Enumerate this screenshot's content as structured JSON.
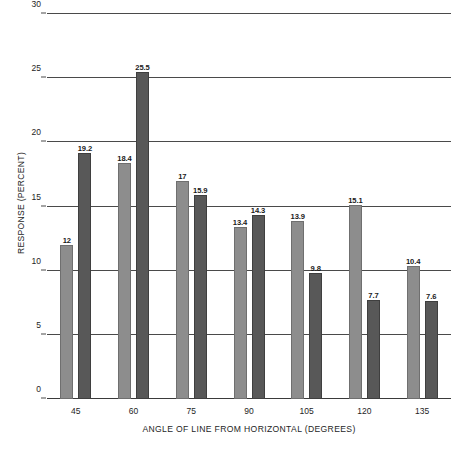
{
  "chart_data": {
    "type": "bar",
    "title": "",
    "xlabel": "ANGLE OF LINE FROM HORIZONTAL (DEGREES)",
    "ylabel": "RESPONSE (PERCENT)",
    "categories": [
      "45",
      "60",
      "75",
      "90",
      "105",
      "120",
      "135"
    ],
    "ylim": [
      0,
      30
    ],
    "yticks": [
      "0",
      "5",
      "10",
      "15",
      "20",
      "25",
      "30"
    ],
    "ytick_values": [
      0,
      5,
      10,
      15,
      20,
      25,
      30
    ],
    "grid": true,
    "legend": "none",
    "series": [
      {
        "name": "light-gray-series",
        "color": "#8d8d8d",
        "values": [
          12,
          18.4,
          17,
          13.4,
          13.9,
          15.1,
          10.4
        ],
        "labels": [
          "12",
          "18.4",
          "17",
          "13.4",
          "13.9",
          "15.1",
          "10.4"
        ]
      },
      {
        "name": "dark-gray-series",
        "color": "#585858",
        "values": [
          19.2,
          25.5,
          15.9,
          14.3,
          9.8,
          7.7,
          7.6
        ],
        "labels": [
          "19.2",
          "25.5",
          "15.9",
          "14.3",
          "9.8",
          "7.7",
          "7.6"
        ]
      }
    ]
  },
  "caption": {
    "text": ""
  }
}
